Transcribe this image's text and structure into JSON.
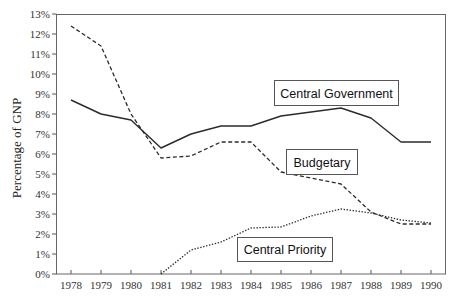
{
  "chart_data": {
    "type": "line",
    "title": "",
    "xlabel": "",
    "ylabel": "Percentage of GNP",
    "ylim": [
      0,
      13
    ],
    "yticks": [
      "0%",
      "1%",
      "2%",
      "3%",
      "4%",
      "5%",
      "6%",
      "7%",
      "8%",
      "9%",
      "10%",
      "11%",
      "12%",
      "13%"
    ],
    "x": [
      1978,
      1979,
      1980,
      1981,
      1982,
      1983,
      1984,
      1985,
      1986,
      1987,
      1988,
      1989,
      1990
    ],
    "grid": false,
    "legend": "inline-callouts",
    "series": [
      {
        "name": "Central Government",
        "style": "solid",
        "values": [
          8.7,
          8.0,
          7.7,
          6.3,
          7.0,
          7.4,
          7.4,
          7.9,
          8.1,
          8.3,
          7.8,
          6.6,
          6.6
        ],
        "label_box": {
          "x": 274,
          "y": 80,
          "w": 124,
          "h": 25
        }
      },
      {
        "name": "Budgetary",
        "style": "dashed",
        "values": [
          12.4,
          11.4,
          8.0,
          5.8,
          5.9,
          6.6,
          6.6,
          5.1,
          4.8,
          4.5,
          3.1,
          2.5,
          2.5
        ],
        "label_box": {
          "x": 286,
          "y": 149,
          "w": 71,
          "h": 25
        }
      },
      {
        "name": "Central Priority",
        "style": "dotted",
        "values": [
          null,
          null,
          null,
          0.0,
          1.2,
          1.6,
          2.3,
          2.35,
          2.9,
          3.25,
          3.05,
          2.7,
          2.55
        ],
        "label_box": {
          "x": 237,
          "y": 237,
          "w": 95,
          "h": 24
        }
      }
    ]
  },
  "colors": {
    "line": "#2b2b2b",
    "frame": "#666666",
    "background": "#ffffff"
  }
}
